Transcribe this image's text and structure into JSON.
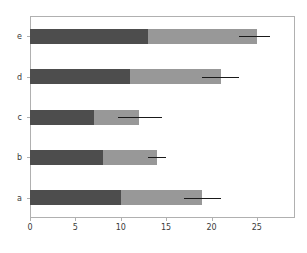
{
  "chart_data": {
    "type": "bar",
    "orientation": "horizontal",
    "stacked": true,
    "title": "",
    "xlabel": "",
    "ylabel": "",
    "categories": [
      "a",
      "b",
      "c",
      "d",
      "e"
    ],
    "xticks": [
      0,
      5,
      10,
      15,
      20,
      25
    ],
    "xtick_labels": [
      "0",
      "5",
      "10",
      "15",
      "20",
      "25"
    ],
    "xlim": [
      0,
      29.2
    ],
    "grid": false,
    "legend": "none",
    "series": [
      {
        "name": "base",
        "color": "#4d4d4d",
        "values": [
          10,
          8,
          7,
          11,
          13
        ]
      },
      {
        "name": "top",
        "color": "#989898",
        "values": [
          9,
          6,
          5,
          10,
          12
        ]
      }
    ],
    "totals": [
      19,
      14,
      12,
      21,
      25
    ],
    "error_bars": {
      "color": "#1a1a1a",
      "capsize": 0,
      "low": [
        17.0,
        13.0,
        9.7,
        19.0,
        23.0
      ],
      "high": [
        21.0,
        15.0,
        14.5,
        23.0,
        26.5
      ]
    }
  },
  "figure": {
    "background": "#ffffff",
    "axes_background": "#ffffff",
    "spine_color": "#b0b0b0",
    "tick_label_color": "#3a3a3a"
  }
}
